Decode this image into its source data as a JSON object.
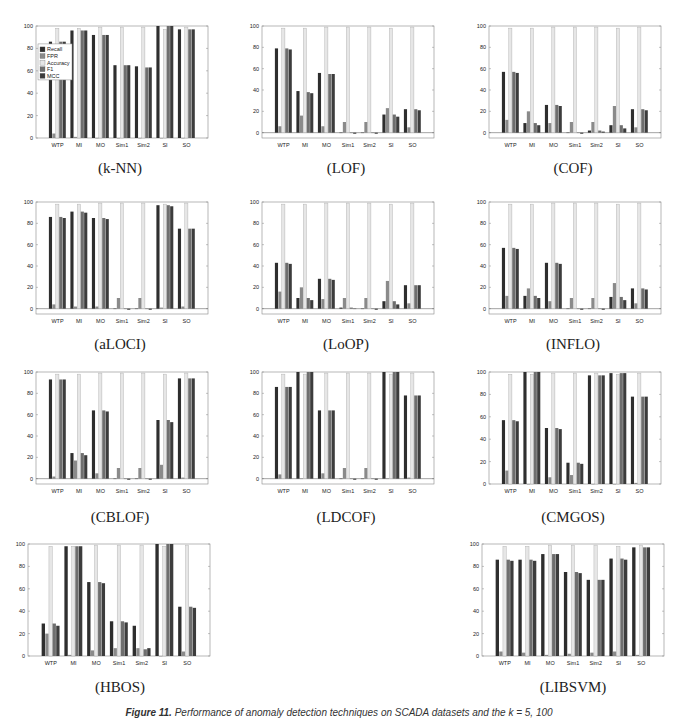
{
  "figure": {
    "caption_label": "Figure 11.",
    "caption_text": "Performance of anomaly detection techniques on SCADA datasets and the k = 5, 100"
  },
  "series_colors": {
    "Recall": "#2e2e2e",
    "FPR": "#8a8a8a",
    "Accuracy": "#e6e6e6",
    "F1": "#6e6e6e",
    "MCC": "#3c3c3c"
  },
  "chart_data": [
    {
      "type": "bar",
      "title": "(k-NN)",
      "categories": [
        "WTP",
        "MI",
        "MO",
        "Sim1",
        "Sim2",
        "SI",
        "SO"
      ],
      "ylim": [
        0,
        100
      ],
      "yticks": [
        0,
        20,
        40,
        60,
        80,
        100
      ],
      "legend": [
        "Recall",
        "FPR",
        "Accuracy",
        "F1",
        "MCC"
      ],
      "legend_position": "left",
      "series": [
        {
          "name": "Recall",
          "values": [
            86,
            96,
            92,
            65,
            64,
            100,
            97
          ]
        },
        {
          "name": "FPR",
          "values": [
            4,
            1,
            0,
            0,
            0,
            0,
            0
          ]
        },
        {
          "name": "Accuracy",
          "values": [
            98,
            98,
            99,
            99,
            99,
            97,
            99
          ]
        },
        {
          "name": "F1",
          "values": [
            86,
            96,
            92,
            65,
            63,
            100,
            97
          ]
        },
        {
          "name": "MCC",
          "values": [
            86,
            96,
            92,
            65,
            63,
            100,
            97
          ]
        }
      ]
    },
    {
      "type": "bar",
      "title": "(LOF)",
      "categories": [
        "WTP",
        "MI",
        "MO",
        "Sim1",
        "Sim2",
        "SI",
        "SO"
      ],
      "ylim": [
        -5,
        100
      ],
      "yticks": [
        0,
        20,
        40,
        60,
        80,
        100
      ],
      "series": [
        {
          "name": "Recall",
          "values": [
            79,
            39,
            56,
            0,
            0,
            17,
            22
          ]
        },
        {
          "name": "FPR",
          "values": [
            6,
            16,
            6,
            10,
            10,
            23,
            5
          ]
        },
        {
          "name": "Accuracy",
          "values": [
            98,
            98,
            99,
            99,
            99,
            98,
            99
          ]
        },
        {
          "name": "F1",
          "values": [
            79,
            38,
            55,
            0,
            0,
            17,
            22
          ]
        },
        {
          "name": "MCC",
          "values": [
            78,
            37,
            55,
            -1,
            -1,
            15,
            21
          ]
        }
      ]
    },
    {
      "type": "bar",
      "title": "(COF)",
      "categories": [
        "WTP",
        "MI",
        "MO",
        "Sim1",
        "Sim2",
        "SI",
        "SO"
      ],
      "ylim": [
        -5,
        100
      ],
      "yticks": [
        0,
        20,
        40,
        60,
        80,
        100
      ],
      "series": [
        {
          "name": "Recall",
          "values": [
            57,
            9,
            26,
            0,
            2,
            7,
            22
          ]
        },
        {
          "name": "FPR",
          "values": [
            12,
            20,
            9,
            10,
            10,
            25,
            5
          ]
        },
        {
          "name": "Accuracy",
          "values": [
            98,
            98,
            99,
            99,
            99,
            98,
            99
          ]
        },
        {
          "name": "F1",
          "values": [
            57,
            9,
            26,
            0,
            2,
            7,
            22
          ]
        },
        {
          "name": "MCC",
          "values": [
            56,
            7,
            25,
            -1,
            1,
            4,
            21
          ]
        }
      ]
    },
    {
      "type": "bar",
      "title": "(aLOCI)",
      "categories": [
        "WTP",
        "MI",
        "MO",
        "Sim1",
        "Sim2",
        "SI",
        "SO"
      ],
      "ylim": [
        -5,
        100
      ],
      "yticks": [
        0,
        20,
        40,
        60,
        80,
        100
      ],
      "series": [
        {
          "name": "Recall",
          "values": [
            86,
            91,
            85,
            0,
            0,
            97,
            75
          ]
        },
        {
          "name": "FPR",
          "values": [
            4,
            2,
            2,
            10,
            10,
            1,
            2
          ]
        },
        {
          "name": "Accuracy",
          "values": [
            98,
            98,
            99,
            99,
            99,
            98,
            99
          ]
        },
        {
          "name": "F1",
          "values": [
            86,
            91,
            85,
            0,
            0,
            97,
            75
          ]
        },
        {
          "name": "MCC",
          "values": [
            85,
            90,
            84,
            -1,
            -1,
            96,
            75
          ]
        }
      ]
    },
    {
      "type": "bar",
      "title": "(LoOP)",
      "categories": [
        "WTP",
        "MI",
        "MO",
        "Sim1",
        "Sim2",
        "SI",
        "SO"
      ],
      "ylim": [
        -5,
        100
      ],
      "yticks": [
        0,
        20,
        40,
        60,
        80,
        100
      ],
      "series": [
        {
          "name": "Recall",
          "values": [
            43,
            10,
            28,
            1,
            0,
            7,
            22
          ]
        },
        {
          "name": "FPR",
          "values": [
            16,
            20,
            9,
            10,
            10,
            26,
            5
          ]
        },
        {
          "name": "Accuracy",
          "values": [
            98,
            98,
            99,
            99,
            99,
            98,
            99
          ]
        },
        {
          "name": "F1",
          "values": [
            43,
            10,
            28,
            1,
            0,
            7,
            22
          ]
        },
        {
          "name": "MCC",
          "values": [
            42,
            8,
            27,
            0,
            -1,
            4,
            22
          ]
        }
      ]
    },
    {
      "type": "bar",
      "title": "(INFLO)",
      "categories": [
        "WTP",
        "MI",
        "MO",
        "Sim1",
        "Sim2",
        "SI",
        "SO"
      ],
      "ylim": [
        -5,
        100
      ],
      "yticks": [
        0,
        20,
        40,
        60,
        80,
        100
      ],
      "series": [
        {
          "name": "Recall",
          "values": [
            57,
            12,
            43,
            0,
            0,
            11,
            19
          ]
        },
        {
          "name": "FPR",
          "values": [
            12,
            19,
            7,
            10,
            10,
            24,
            5
          ]
        },
        {
          "name": "Accuracy",
          "values": [
            98,
            98,
            99,
            99,
            99,
            98,
            99
          ]
        },
        {
          "name": "F1",
          "values": [
            57,
            12,
            43,
            0,
            0,
            11,
            19
          ]
        },
        {
          "name": "MCC",
          "values": [
            56,
            10,
            42,
            -1,
            -1,
            8,
            18
          ]
        }
      ]
    },
    {
      "type": "bar",
      "title": "(CBLOF)",
      "categories": [
        "WTP",
        "MI",
        "MO",
        "Sim1",
        "Sim2",
        "SI",
        "SO"
      ],
      "ylim": [
        -5,
        100
      ],
      "yticks": [
        0,
        20,
        40,
        60,
        80,
        100
      ],
      "series": [
        {
          "name": "Recall",
          "values": [
            93,
            24,
            64,
            0,
            0,
            55,
            94
          ]
        },
        {
          "name": "FPR",
          "values": [
            2,
            17,
            5,
            10,
            10,
            13,
            1
          ]
        },
        {
          "name": "Accuracy",
          "values": [
            98,
            98,
            99,
            99,
            99,
            98,
            99
          ]
        },
        {
          "name": "F1",
          "values": [
            93,
            24,
            64,
            0,
            0,
            55,
            94
          ]
        },
        {
          "name": "MCC",
          "values": [
            93,
            22,
            63,
            -1,
            -1,
            53,
            94
          ]
        }
      ]
    },
    {
      "type": "bar",
      "title": "(LDCOF)",
      "categories": [
        "WTP",
        "MI",
        "MO",
        "Sim1",
        "Sim2",
        "SI",
        "SO"
      ],
      "ylim": [
        -5,
        100
      ],
      "yticks": [
        0,
        20,
        40,
        60,
        80,
        100
      ],
      "series": [
        {
          "name": "Recall",
          "values": [
            86,
            100,
            64,
            0,
            0,
            100,
            78
          ]
        },
        {
          "name": "FPR",
          "values": [
            4,
            0,
            5,
            10,
            10,
            0,
            1
          ]
        },
        {
          "name": "Accuracy",
          "values": [
            98,
            98,
            99,
            99,
            99,
            98,
            99
          ]
        },
        {
          "name": "F1",
          "values": [
            86,
            100,
            64,
            0,
            0,
            100,
            78
          ]
        },
        {
          "name": "MCC",
          "values": [
            86,
            100,
            64,
            -1,
            -1,
            100,
            78
          ]
        }
      ]
    },
    {
      "type": "bar",
      "title": "(CMGOS)",
      "categories": [
        "WTP",
        "MI",
        "MO",
        "Sim1",
        "Sim2",
        "SI",
        "SO"
      ],
      "ylim": [
        0,
        100
      ],
      "yticks": [
        0,
        20,
        40,
        60,
        80,
        100
      ],
      "series": [
        {
          "name": "Recall",
          "values": [
            57,
            100,
            50,
            19,
            97,
            99,
            78
          ]
        },
        {
          "name": "FPR",
          "values": [
            12,
            0,
            6,
            8,
            0,
            0,
            1
          ]
        },
        {
          "name": "Accuracy",
          "values": [
            98,
            98,
            99,
            99,
            99,
            98,
            99
          ]
        },
        {
          "name": "F1",
          "values": [
            57,
            100,
            50,
            19,
            97,
            99,
            78
          ]
        },
        {
          "name": "MCC",
          "values": [
            56,
            100,
            49,
            18,
            97,
            99,
            78
          ]
        }
      ]
    },
    {
      "type": "bar",
      "title": "(HBOS)",
      "categories": [
        "WTP",
        "MI",
        "MO",
        "Sim1",
        "Sim2",
        "SI",
        "SO"
      ],
      "ylim": [
        0,
        100
      ],
      "yticks": [
        0,
        20,
        40,
        60,
        80,
        100
      ],
      "series": [
        {
          "name": "Recall",
          "values": [
            29,
            98,
            66,
            31,
            27,
            100,
            44
          ]
        },
        {
          "name": "FPR",
          "values": [
            20,
            1,
            5,
            7,
            7,
            0,
            4
          ]
        },
        {
          "name": "Accuracy",
          "values": [
            98,
            98,
            99,
            99,
            99,
            98,
            99
          ]
        },
        {
          "name": "F1",
          "values": [
            29,
            98,
            66,
            31,
            6,
            100,
            44
          ]
        },
        {
          "name": "MCC",
          "values": [
            27,
            98,
            65,
            30,
            7,
            100,
            43
          ]
        }
      ]
    },
    {
      "type": "bar",
      "title": "(LIBSVM)",
      "categories": [
        "WTP",
        "MI",
        "MO",
        "Sim1",
        "Sim2",
        "SI",
        "SO"
      ],
      "ylim": [
        0,
        100
      ],
      "yticks": [
        0,
        20,
        40,
        60,
        80,
        100
      ],
      "series": [
        {
          "name": "Recall",
          "values": [
            86,
            86,
            91,
            75,
            68,
            87,
            97
          ]
        },
        {
          "name": "FPR",
          "values": [
            4,
            3,
            1,
            2,
            3,
            4,
            1
          ]
        },
        {
          "name": "Accuracy",
          "values": [
            98,
            98,
            99,
            99,
            99,
            98,
            99
          ]
        },
        {
          "name": "F1",
          "values": [
            86,
            86,
            91,
            75,
            68,
            87,
            97
          ]
        },
        {
          "name": "MCC",
          "values": [
            85,
            85,
            91,
            74,
            68,
            86,
            97
          ]
        }
      ]
    }
  ]
}
